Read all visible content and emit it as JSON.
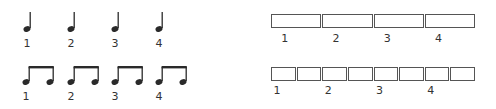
{
  "left_panel": {
    "quarter_row": {
      "note_type": "quarter-note",
      "notes": [
        {
          "x": 27,
          "label": "1"
        },
        {
          "x": 71,
          "label": "2"
        },
        {
          "x": 115,
          "label": "3"
        },
        {
          "x": 159,
          "label": "4"
        }
      ]
    },
    "eighth_row": {
      "note_type": "beamed-eighth-pair",
      "pairs": [
        {
          "x": 26,
          "label": "1"
        },
        {
          "x": 71,
          "label": "2"
        },
        {
          "x": 115,
          "label": "3"
        },
        {
          "x": 159,
          "label": "4"
        }
      ]
    }
  },
  "right_panel": {
    "top_row": {
      "box_count": 4,
      "labels": [
        "1",
        "2",
        "3",
        "4"
      ]
    },
    "bottom_row": {
      "box_count": 8,
      "labels": [
        "1",
        "2",
        "3",
        "4"
      ]
    }
  },
  "colors": {
    "ink": "#2a2a2a",
    "box_border": "#555555",
    "background": "#ffffff"
  }
}
